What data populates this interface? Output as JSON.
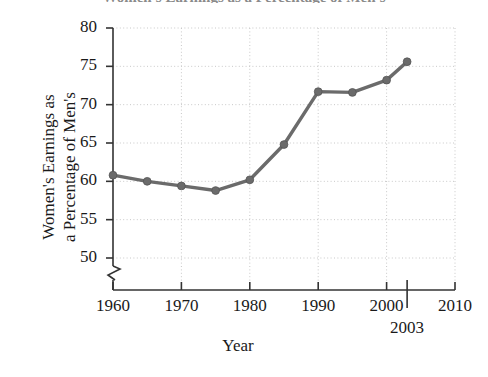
{
  "chart_data": {
    "type": "line",
    "title": "Women's Earnings as a Percentage of Men's",
    "xlabel": "Year",
    "ylabel": "Women's Earnings as a Percentage of Men's",
    "ylabel_lines": [
      "Women's Earnings as",
      "a Percentage of Men's"
    ],
    "x": [
      1960,
      1965,
      1970,
      1975,
      1980,
      1985,
      1990,
      1995,
      2000,
      2003
    ],
    "values": [
      60.8,
      60.0,
      59.4,
      58.8,
      60.2,
      64.8,
      71.7,
      71.6,
      73.2,
      75.6
    ],
    "series": [
      {
        "name": "Women's earnings as a percentage of men's",
        "values": [
          60.8,
          60.0,
          59.4,
          58.8,
          60.2,
          64.8,
          71.7,
          71.6,
          73.2,
          75.6
        ]
      }
    ],
    "xlim": [
      1960,
      2010
    ],
    "ylim": [
      50,
      80
    ],
    "xticks": [
      1960,
      1970,
      1980,
      1990,
      2000,
      2010
    ],
    "xtick_labels": [
      "1960",
      "1970",
      "1980",
      "1990",
      "2000",
      "2010"
    ],
    "yticks": [
      50,
      55,
      60,
      65,
      70,
      75,
      80
    ],
    "ytick_labels": [
      "50",
      "55",
      "60",
      "65",
      "70",
      "75",
      "80"
    ],
    "grid": true,
    "legend": false,
    "legend_position": "none",
    "y_axis_break": true,
    "annotations": [
      {
        "label": "2003",
        "x": 2003,
        "kind": "extended-x-tick"
      }
    ],
    "line_color": "#6b6b6b",
    "marker_color": "#6b6b6b",
    "marker": "circle",
    "grid_color": "#c8c8c8",
    "axis_color": "#333333",
    "background": "#ffffff"
  },
  "axis_title_x": "Year",
  "callout": {
    "label_2003": "2003"
  }
}
